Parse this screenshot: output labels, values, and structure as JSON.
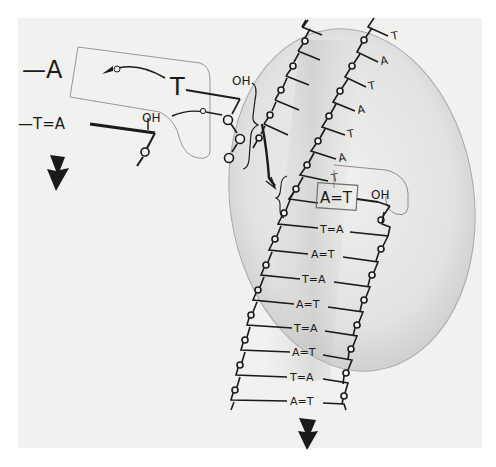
{
  "figure": {
    "paper_color": "#f1f1f0",
    "ink_color": "#1a1a1a",
    "enzyme_fill": "#dcdcdb",
    "enzyme_edge": "#9a9a99"
  },
  "incoming": {
    "left_base_label": "—A",
    "left_pair_label": "—T=A",
    "incoming_base": "T",
    "hydroxyl_top": "OH",
    "hydroxyl_primer": "OH"
  },
  "template_strand": {
    "bases": [
      "T",
      "A",
      "T",
      "A",
      "T",
      "A",
      "T"
    ]
  },
  "active_site": {
    "pair_label": "A=T",
    "hydroxyl": "OH"
  },
  "duplex": {
    "pairs": [
      "T=A",
      "A=T",
      "T=A",
      "A=T",
      "T=A",
      "A=T",
      "T=A",
      "A=T"
    ]
  },
  "arrows": {
    "left_direction": "down",
    "bottom_direction": "down"
  }
}
